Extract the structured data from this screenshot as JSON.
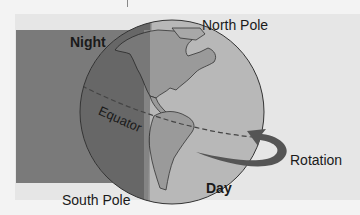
{
  "diagram": {
    "labels": {
      "night": "Night",
      "day": "Day",
      "north_pole": "North Pole",
      "south_pole": "South Pole",
      "equator": "Equator",
      "rotation": "Rotation"
    },
    "colors": {
      "page_bg": "#f3f3f3",
      "panel_bg": "#e6e6e6",
      "night_shade": "#7a7a7a",
      "globe_day": "#b8b8b8",
      "globe_night": "#858585",
      "land_day": "#9a9a9a",
      "land_night": "#6e6e6e",
      "outline": "#333333",
      "arrow": "#555555"
    }
  }
}
